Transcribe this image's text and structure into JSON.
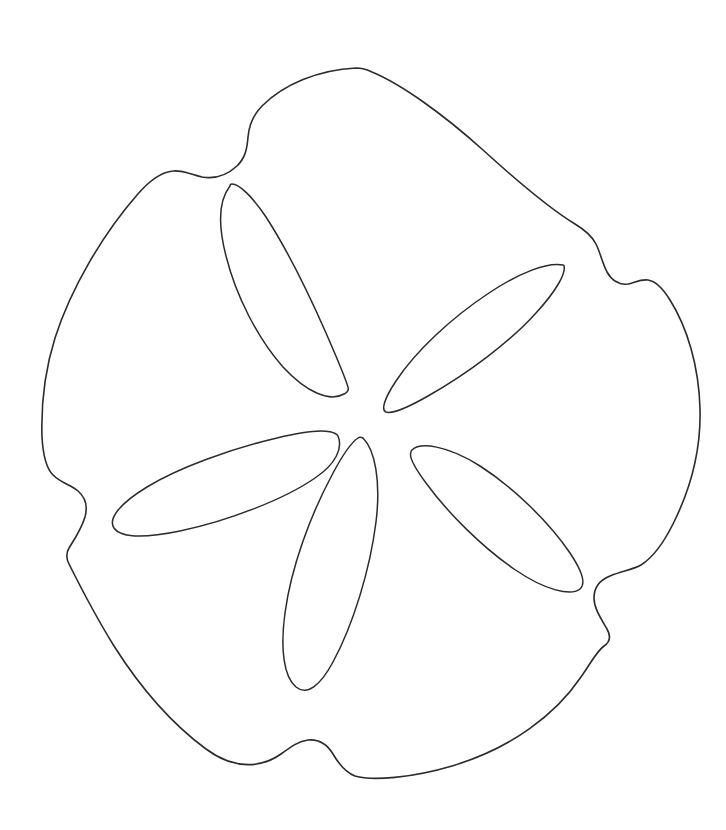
{
  "artwork": {
    "title": "Sand Dollar Outline",
    "subject": "sand-dollar",
    "style": "line-drawing",
    "description": "Black-and-white contour line drawing of a sand dollar (sea urchin test) with a five-petal aboral petalodium pattern and five notched lunules around the rim.",
    "background_color": "#ffffff",
    "line_color": "#2b2b2b",
    "line_width_px": 1.6,
    "canvas": {
      "width": 726,
      "height": 830
    }
  },
  "geometry": {
    "body": {
      "name": "sand-dollar-body-outline",
      "center": {
        "x": 372,
        "y": 421
      },
      "bounds": {
        "left": 42,
        "top": 68,
        "right": 701,
        "bottom": 779
      },
      "notch_count": 5,
      "notches": [
        {
          "name": "notch-top-left",
          "x": 247,
          "y": 140
        },
        {
          "name": "notch-right-upper",
          "x": 622,
          "y": 268
        },
        {
          "name": "notch-right-lower",
          "x": 607,
          "y": 602
        },
        {
          "name": "notch-bottom",
          "x": 330,
          "y": 748
        },
        {
          "name": "notch-left",
          "x": 76,
          "y": 493
        }
      ],
      "path": "M 356 68 C 318 70 284 84 262 106 C 252 116 249 126 248 137 C 247 150 245 158 237 166 C 226 176 213 179 202 177 C 190 174 182 170 173 171 C 161 172 149 181 137 195 C 103 234 71 288 55 338 C 44 373 41 405 42 437 C 43 455 46 468 53 475 C 61 483 71 485 78 491 C 85 497 88 506 85 517 C 81 530 74 540 69 548 C 66 553 66 558 69 564 C 80 586 96 617 114 646 C 140 687 172 724 206 749 C 237 772 264 766 281 754 C 292 746 299 741 308 740 C 319 739 327 744 333 754 C 340 766 347 773 355 776 C 372 781 412 778 452 766 C 512 748 556 714 581 677 C 592 661 597 651 604 646 C 610 642 611 636 607 629 C 600 617 594 608 594 598 C 594 587 600 580 610 576 C 622 571 632 570 641 565 C 652 558 663 544 673 524 C 692 486 701 447 700 409 C 699 366 687 327 670 300 C 662 287 655 281 648 280 C 640 279 634 283 628 284 C 620 285 612 281 607 272 C 602 262 600 252 596 244 C 592 236 585 230 575 224 C 547 207 516 180 483 150 C 443 114 401 84 372 72 C 366 69 361 68 356 68 Z"
    },
    "petals": [
      {
        "name": "petal-north",
        "orientation_deg": -26,
        "outer_tip": {
          "x": 230,
          "y": 186
        },
        "inner_tip": {
          "x": 348,
          "y": 393
        },
        "path": "M 230 186 C 219 200 218 225 226 256 C 236 296 258 339 283 367 C 307 393 330 402 344 394 C 348 392 349 390 348 387 C 344 374 336 356 326 333 C 308 292 286 248 266 217 C 252 196 239 184 232 184 C 231 184 230 185 230 186 Z"
      },
      {
        "name": "petal-northeast",
        "orientation_deg": 37,
        "outer_tip": {
          "x": 563,
          "y": 265
        },
        "inner_tip": {
          "x": 385,
          "y": 410
        },
        "path": "M 563 265 C 547 262 519 273 489 293 C 451 318 415 352 396 381 C 384 399 381 410 386 412 C 392 414 407 408 428 396 C 467 374 510 342 536 313 C 557 290 566 273 564 266 C 564 265 564 265 563 265 Z"
      },
      {
        "name": "petal-east-lower",
        "orientation_deg": 39,
        "outer_tip": {
          "x": 583,
          "y": 586
        },
        "inner_tip": {
          "x": 411,
          "y": 452
        },
        "path": "M 411 452 C 409 456 414 467 426 483 C 447 512 482 547 514 569 C 546 591 571 596 580 589 C 586 584 582 571 570 553 C 549 522 513 487 480 466 C 447 445 420 442 412 450 C 411 451 411 451 411 452 Z"
      },
      {
        "name": "petal-south",
        "orientation_deg": 11,
        "outer_tip": {
          "x": 313,
          "y": 691
        },
        "inner_tip": {
          "x": 358,
          "y": 438
        },
        "path": "M 358 438 C 352 442 342 456 332 475 C 310 516 291 568 285 613 C 280 650 284 677 296 687 C 307 696 320 686 333 662 C 353 625 370 570 376 522 C 381 481 375 450 363 438 C 361 437 359 437 358 438 Z"
      },
      {
        "name": "petal-west",
        "orientation_deg": -12,
        "outer_tip": {
          "x": 111,
          "y": 491
        },
        "inner_tip": {
          "x": 336,
          "y": 434
        },
        "path": "M 336 434 C 328 429 306 431 277 438 C 230 449 178 468 147 487 C 119 504 108 519 114 528 C 121 538 146 538 180 531 C 228 521 285 499 315 478 C 336 464 343 448 338 436 C 337 435 337 434 336 434 Z"
      }
    ]
  }
}
